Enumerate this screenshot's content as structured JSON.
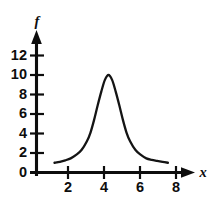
{
  "chart_data": {
    "type": "line",
    "title": "",
    "subtitle": "",
    "xlabel": "x",
    "ylabel": "f",
    "xlim": [
      0,
      8.8
    ],
    "ylim": [
      0,
      13.2
    ],
    "grid": false,
    "legend": null,
    "annotations": [],
    "x_ticks": [
      {
        "value": 2,
        "label": "2"
      },
      {
        "value": 4,
        "label": "4"
      },
      {
        "value": 6,
        "label": "6"
      },
      {
        "value": 8,
        "label": "8"
      }
    ],
    "y_ticks": [
      {
        "value": 0,
        "label": "0"
      },
      {
        "value": 2,
        "label": "2"
      },
      {
        "value": 4,
        "label": "4"
      },
      {
        "value": 6,
        "label": "6"
      },
      {
        "value": 8,
        "label": "8"
      },
      {
        "value": 10,
        "label": "10"
      },
      {
        "value": 12,
        "label": "12"
      }
    ],
    "series": [
      {
        "name": "f",
        "color": "#141414",
        "peak": {
          "x": 4.0,
          "y": 10.0
        },
        "x": [
          1.0,
          1.3,
          1.6,
          1.9,
          2.2,
          2.5,
          2.8,
          3.0,
          3.2,
          3.4,
          3.6,
          3.8,
          4.0,
          4.2,
          4.4,
          4.6,
          4.8,
          5.0,
          5.2,
          5.5,
          5.8,
          6.1,
          6.4,
          6.7,
          7.0,
          7.3
        ],
        "y": [
          1.0,
          1.1,
          1.25,
          1.45,
          1.8,
          2.3,
          3.2,
          4.1,
          5.4,
          6.9,
          8.3,
          9.5,
          10.0,
          9.5,
          8.3,
          6.9,
          5.4,
          4.1,
          3.2,
          2.3,
          1.8,
          1.45,
          1.3,
          1.2,
          1.1,
          1.0
        ]
      }
    ]
  },
  "axes": {
    "y_axis_name": "vertical-axis",
    "x_axis_name": "horizontal-axis"
  }
}
